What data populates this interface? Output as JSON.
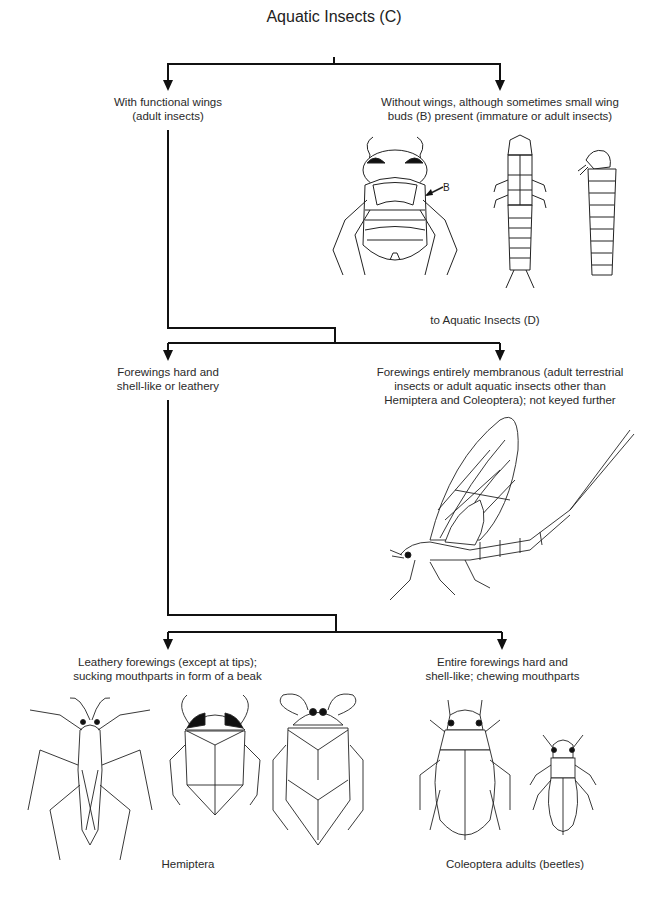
{
  "title": "Aquatic Insects (C)",
  "nodes": {
    "with_wings": {
      "line1": "With functional wings",
      "line2": "(adult insects)"
    },
    "without_wings": {
      "line1": "Without wings, although sometimes small wing",
      "line2": "buds (B) present (immature or adult insects)",
      "wing_bud_label": "B",
      "next": "to Aquatic Insects (D)"
    },
    "forewings_hard": {
      "line1": "Forewings hard and",
      "line2": "shell-like or leathery"
    },
    "forewings_membranous": {
      "line1": "Forewings entirely membranous (adult terrestrial",
      "line2": "insects or adult aquatic insects other than",
      "line3": "Hemiptera and Coleoptera); not keyed further"
    },
    "leathery": {
      "line1": "Leathery forewings (except at tips);",
      "line2": "sucking mouthparts in form of a beak",
      "group": "Hemiptera"
    },
    "hard_entire": {
      "line1": "Entire forewings hard and",
      "line2": "shell-like; chewing mouthparts",
      "group": "Coleoptera adults (beetles)"
    }
  },
  "illustrations": [
    "water-beetle-larva",
    "hellgrammite-larva",
    "caddisfly-larva-case",
    "mayfly-adult",
    "water-strider",
    "backswimmer",
    "giant-water-bug",
    "diving-beetle",
    "small-beetle"
  ]
}
